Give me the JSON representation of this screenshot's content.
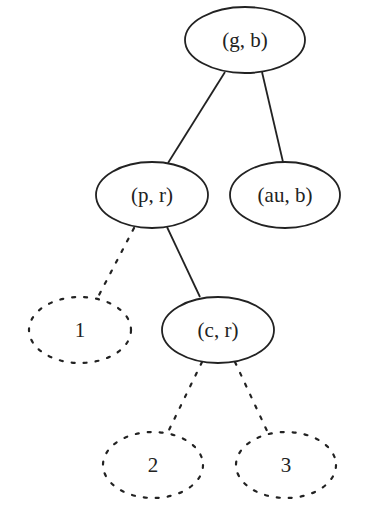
{
  "diagram": {
    "type": "tree",
    "stroke_color": "#222222",
    "background": "#ffffff",
    "nodes": [
      {
        "id": "gb",
        "label": "(g, b)",
        "style": "solid",
        "cx": 245,
        "cy": 40,
        "rx": 60,
        "ry": 33
      },
      {
        "id": "pr",
        "label": "(p, r)",
        "style": "solid",
        "cx": 152,
        "cy": 195,
        "rx": 56,
        "ry": 33
      },
      {
        "id": "aub",
        "label": "(au, b)",
        "style": "solid",
        "cx": 285,
        "cy": 195,
        "rx": 55,
        "ry": 33
      },
      {
        "id": "n1",
        "label": "1",
        "style": "dotted",
        "cx": 80,
        "cy": 330,
        "rx": 51,
        "ry": 33
      },
      {
        "id": "cr",
        "label": "(c, r)",
        "style": "solid",
        "cx": 218,
        "cy": 330,
        "rx": 56,
        "ry": 33
      },
      {
        "id": "n2",
        "label": "2",
        "style": "dotted",
        "cx": 153,
        "cy": 465,
        "rx": 50,
        "ry": 33
      },
      {
        "id": "n3",
        "label": "3",
        "style": "dotted",
        "cx": 286,
        "cy": 465,
        "rx": 50,
        "ry": 33
      }
    ],
    "edges": [
      {
        "from": "gb",
        "to": "pr",
        "style": "solid",
        "x1": 225,
        "y1": 72,
        "x2": 168,
        "y2": 163
      },
      {
        "from": "gb",
        "to": "aub",
        "style": "solid",
        "x1": 262,
        "y1": 72,
        "x2": 283,
        "y2": 162
      },
      {
        "from": "pr",
        "to": "n1",
        "style": "dotted",
        "x1": 134,
        "y1": 228,
        "x2": 98,
        "y2": 297
      },
      {
        "from": "pr",
        "to": "cr",
        "style": "solid",
        "x1": 167,
        "y1": 227,
        "x2": 200,
        "y2": 297
      },
      {
        "from": "cr",
        "to": "n2",
        "style": "dotted",
        "x1": 202,
        "y1": 362,
        "x2": 168,
        "y2": 432
      },
      {
        "from": "cr",
        "to": "n3",
        "style": "dotted",
        "x1": 235,
        "y1": 362,
        "x2": 268,
        "y2": 433
      }
    ]
  }
}
